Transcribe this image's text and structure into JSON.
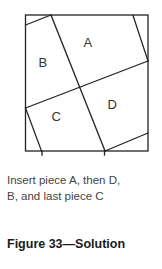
{
  "diagram": {
    "pieces": [
      {
        "id": "A",
        "label": "A",
        "x": 88,
        "y": 47
      },
      {
        "id": "B",
        "label": "B",
        "x": 43,
        "y": 67
      },
      {
        "id": "C",
        "label": "C",
        "x": 56,
        "y": 121
      },
      {
        "id": "D",
        "label": "D",
        "x": 112,
        "y": 109
      }
    ],
    "line_color": "#222222"
  },
  "caption": {
    "line1": "Insert piece A, then D,",
    "line2": "B, and last piece C"
  },
  "figure": {
    "title": "Figure 33—Solution"
  }
}
